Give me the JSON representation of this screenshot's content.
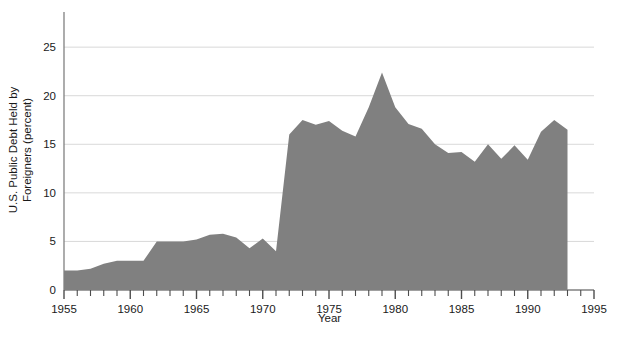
{
  "chart_data": {
    "type": "area",
    "title": "",
    "xlabel": "Year",
    "ylabel": "U.S. Public Debt Held by Foreigners (percent)",
    "ylabel_line1": "U.S. Public Debt Held by",
    "ylabel_line2": "Foreigners (percent)",
    "xlim": [
      1955,
      1995
    ],
    "ylim": [
      0,
      28
    ],
    "grid": "horizontal-only",
    "legend": "none",
    "fill_color": "#808080",
    "grid_color": "#d9d9d9",
    "axis_color": "#808080",
    "text_color": "#1a1a1a",
    "ytick_labels": [
      "0",
      "5",
      "10",
      "15",
      "20",
      "25"
    ],
    "ytick_values": [
      0,
      5,
      10,
      15,
      20,
      25
    ],
    "xtick_labels": [
      "1955",
      "1960",
      "1965",
      "1970",
      "1975",
      "1980",
      "1985",
      "1990",
      "1995"
    ],
    "xtick_values": [
      1955,
      1960,
      1965,
      1970,
      1975,
      1980,
      1985,
      1990,
      1995
    ],
    "xtick_minor_step": 1,
    "x": [
      1955,
      1956,
      1957,
      1958,
      1959,
      1960,
      1961,
      1962,
      1963,
      1964,
      1965,
      1966,
      1967,
      1968,
      1969,
      1970,
      1971,
      1972,
      1973,
      1974,
      1975,
      1976,
      1977,
      1978,
      1979,
      1980,
      1981,
      1982,
      1983,
      1984,
      1985,
      1986,
      1987,
      1988,
      1989,
      1990,
      1991,
      1992,
      1993
    ],
    "values": [
      2.0,
      2.0,
      2.2,
      2.7,
      3.0,
      3.0,
      3.0,
      5.0,
      5.0,
      5.0,
      5.2,
      5.7,
      5.8,
      5.4,
      4.3,
      5.3,
      4.0,
      16.0,
      17.5,
      17.0,
      17.4,
      16.4,
      15.8,
      18.8,
      22.4,
      18.8,
      17.1,
      16.6,
      15.0,
      14.1,
      14.2,
      13.2,
      15.0,
      13.5,
      14.9,
      13.4,
      16.3,
      17.5,
      16.5
    ]
  }
}
